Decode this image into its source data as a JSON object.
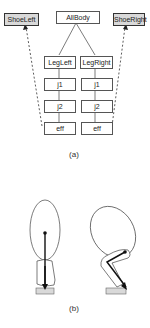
{
  "figure_a": {
    "caption": "(a)",
    "nodes": {
      "shoe_left": "ShoeLeft",
      "all_body": "AllBody",
      "shoe_right": "ShoeRight",
      "leg_left": "LegLeft",
      "leg_right": "LegRight",
      "j1_left": "j1",
      "j1_right": "j1",
      "j2_left": "j2",
      "j2_right": "j2",
      "eff_left": "eff",
      "eff_right": "eff"
    }
  },
  "figure_b": {
    "caption": "(b)",
    "poses": [
      "standing",
      "crouching"
    ]
  }
}
